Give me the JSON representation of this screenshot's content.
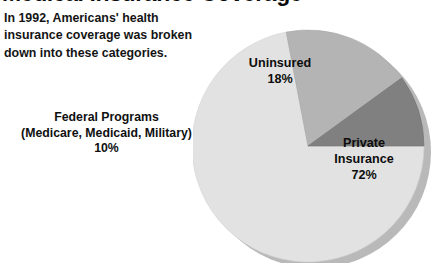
{
  "title": "Medical Insurance Coverage",
  "intro": "In 1992, Americans' health insurance coverage was broken down into these categories.",
  "labels": {
    "federal_name": "Federal Programs",
    "federal_detail": "(Medicare, Medicaid, Military)",
    "federal_value": "10%",
    "uninsured_name": "Uninsured",
    "uninsured_value": "18%",
    "private_name": "Private",
    "private_name2": "Insurance",
    "private_value": "72%"
  },
  "colors": {
    "background": "#ffffff",
    "private": "#e2e2e2",
    "uninsured": "#b4b4b4",
    "federal": "#808080",
    "shadow": "#b9b9b9",
    "text": "#101010"
  },
  "chart_data": {
    "type": "pie",
    "title": "Medical Insurance Coverage",
    "subtitle": "In 1992, Americans' health insurance coverage was broken down into these categories.",
    "categories": [
      "Private Insurance",
      "Uninsured",
      "Federal Programs (Medicare, Medicaid, Military)"
    ],
    "values": [
      72,
      18,
      10
    ],
    "value_labels": [
      "72%",
      "18%",
      "10%"
    ],
    "units": "percent",
    "colors": [
      "#e2e2e2",
      "#b4b4b4",
      "#808080"
    ],
    "legend": "none",
    "label_placement": [
      "inside",
      "inside",
      "outside-left"
    ],
    "start_angle_deg": 0,
    "direction": "counterclockwise",
    "style": "3d-shadow",
    "grid": false,
    "xlabel": "",
    "ylabel": ""
  }
}
